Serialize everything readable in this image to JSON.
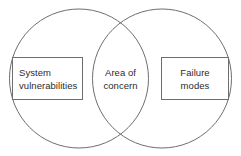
{
  "diagram": {
    "type": "venn",
    "title": "",
    "background_color": "#ffffff",
    "stroke_color": "#6e6e6e",
    "text_color": "#2b2b2b",
    "sets": [
      {
        "id": "left",
        "label": "System\nvulnerabilities",
        "boxed": true,
        "text_align": "left"
      },
      {
        "id": "right",
        "label": "Failure\nmodes",
        "boxed": true,
        "text_align": "center"
      }
    ],
    "intersection": {
      "id": "center",
      "label": "Area of\nconcern",
      "boxed": false,
      "text_align": "center"
    }
  }
}
